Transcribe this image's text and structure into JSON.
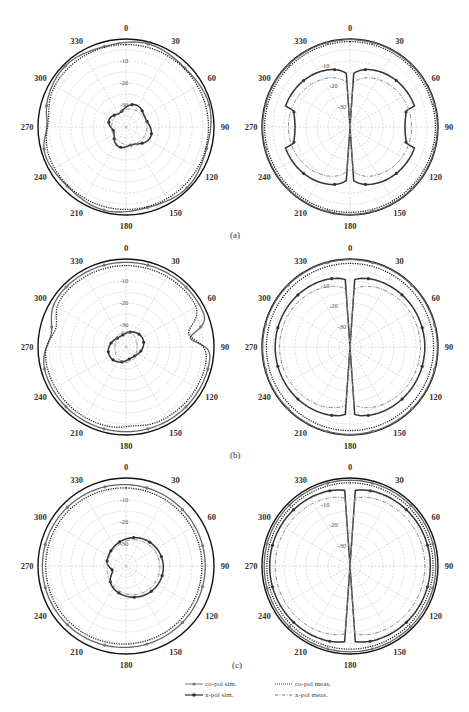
{
  "figure": {
    "panel_labels": [
      "(a)",
      "(b)",
      "(c)"
    ],
    "legend": [
      {
        "label": "co-pol sim.",
        "style": "solid-marker-light"
      },
      {
        "label": "co-pol meas.",
        "style": "dotted"
      },
      {
        "label": "x-pol sim.",
        "style": "solid-marker-dark"
      },
      {
        "label": "x-pol meas.",
        "style": "dash-dot"
      }
    ]
  },
  "chart_data": [
    {
      "type": "polar-line",
      "panel": "(a)",
      "position": "left",
      "title": "",
      "angle_ticks": [
        0,
        30,
        60,
        90,
        120,
        150,
        180,
        210,
        240,
        270,
        300,
        330
      ],
      "radial_ticks": [
        -10,
        -20,
        -30
      ],
      "rlim": [
        -40,
        0
      ],
      "series": [
        {
          "name": "co-pol sim.",
          "shape": "near-omni, ~-1 dB with dips to ~-5 dB near 270"
        },
        {
          "name": "co-pol meas.",
          "shape": "near-omni, ~-2 dB"
        },
        {
          "name": "x-pol sim.",
          "shape": "small lobe, ~-30 to -33 dB"
        },
        {
          "name": "x-pol meas.",
          "shape": "small lobe, ~-32 dB"
        }
      ]
    },
    {
      "type": "polar-line",
      "panel": "(a)",
      "position": "right",
      "angle_ticks": [
        0,
        30,
        60,
        90,
        120,
        150,
        180,
        210,
        240,
        270,
        300,
        330
      ],
      "radial_ticks": [
        -10,
        -20,
        -30
      ],
      "rlim": [
        -40,
        0
      ],
      "series": [
        {
          "name": "co-pol sim.",
          "shape": "omni ~0 dB"
        },
        {
          "name": "co-pol meas.",
          "shape": "omni ~-1 dB"
        },
        {
          "name": "x-pol sim.",
          "shape": "two lobes (figure-8 about vertical), peak ~-8 dB at 45/135/225/315, null at 0/180"
        },
        {
          "name": "x-pol meas.",
          "shape": "two lobes ~-12 dB"
        }
      ]
    },
    {
      "type": "polar-line",
      "panel": "(b)",
      "position": "left",
      "angle_ticks": [
        0,
        30,
        60,
        90,
        120,
        150,
        180,
        210,
        240,
        270,
        300,
        330
      ],
      "radial_ticks": [
        -10,
        -20,
        -30
      ],
      "rlim": [
        -40,
        0
      ],
      "series": [
        {
          "name": "co-pol sim.",
          "shape": "near-omni with notch ~-12 dB at 80"
        },
        {
          "name": "co-pol meas.",
          "shape": "near-omni with notch near 80 and 280"
        },
        {
          "name": "x-pol sim.",
          "shape": "small ~-33 dB"
        },
        {
          "name": "x-pol meas.",
          "shape": "small ~-34 dB"
        }
      ]
    },
    {
      "type": "polar-line",
      "panel": "(b)",
      "position": "right",
      "angle_ticks": [
        0,
        30,
        60,
        90,
        120,
        150,
        180,
        210,
        240,
        270,
        300,
        330
      ],
      "radial_ticks": [
        -10,
        -20,
        -30
      ],
      "rlim": [
        -40,
        0
      ],
      "series": [
        {
          "name": "co-pol sim.",
          "shape": "omni ~0 dB"
        },
        {
          "name": "co-pol meas.",
          "shape": "omni ~-2 dB"
        },
        {
          "name": "x-pol sim.",
          "shape": "two wide lobes ~-6 dB, nulls at 0/180"
        },
        {
          "name": "x-pol meas.",
          "shape": "two lobes ~-8 dB"
        }
      ]
    },
    {
      "type": "polar-line",
      "panel": "(c)",
      "position": "left",
      "angle_ticks": [
        0,
        30,
        60,
        90,
        120,
        150,
        180,
        210,
        240,
        270,
        300,
        330
      ],
      "radial_ticks": [
        -10,
        -20,
        -30
      ],
      "rlim": [
        -40,
        0
      ],
      "series": [
        {
          "name": "co-pol sim.",
          "shape": "near-omni ~-3 dB"
        },
        {
          "name": "co-pol meas.",
          "shape": "near-omni ~-4 dB"
        },
        {
          "name": "x-pol sim.",
          "shape": "kidney lobe ~-25 dB toward 90"
        },
        {
          "name": "x-pol meas.",
          "shape": "kidney lobe ~-26 dB"
        }
      ]
    },
    {
      "type": "polar-line",
      "panel": "(c)",
      "position": "right",
      "angle_ticks": [
        0,
        30,
        60,
        90,
        120,
        150,
        180,
        210,
        240,
        270,
        300,
        330
      ],
      "radial_ticks": [
        -10,
        -20,
        -30
      ],
      "rlim": [
        -40,
        0
      ],
      "series": [
        {
          "name": "co-pol sim.",
          "shape": "omni ~-1 dB"
        },
        {
          "name": "co-pol meas.",
          "shape": "omni ~-2 dB"
        },
        {
          "name": "x-pol sim.",
          "shape": "two lobes ~-3 dB, narrow nulls at 0/180"
        },
        {
          "name": "x-pol meas.",
          "shape": "two lobes ~-6 dB"
        }
      ]
    }
  ]
}
